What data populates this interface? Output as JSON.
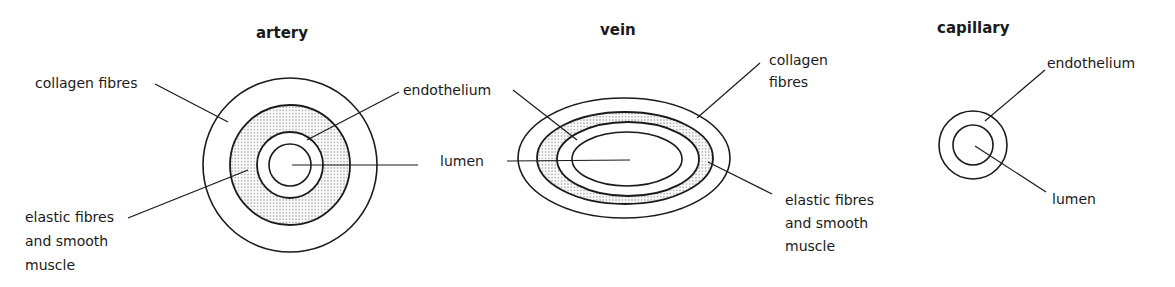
{
  "titles": {
    "artery": "artery",
    "vein": "vein",
    "capillary": "capillary"
  },
  "artery": {
    "labels": {
      "collagen": "collagen fibres",
      "endothelium": "endothelium",
      "lumen": "lumen",
      "elastic_line1": "elastic fibres",
      "elastic_line2": "and smooth",
      "elastic_line3": "muscle"
    }
  },
  "vein": {
    "labels": {
      "collagen_line1": "collagen",
      "collagen_line2": "fibres",
      "elastic_line1": "elastic fibres",
      "elastic_line2": "and smooth",
      "elastic_line3": "muscle"
    }
  },
  "capillary": {
    "labels": {
      "endothelium": "endothelium",
      "lumen": "lumen"
    }
  },
  "colors": {
    "ink": "#1a1a1a",
    "stipple": "#6a6a6a",
    "background": "#ffffff"
  }
}
